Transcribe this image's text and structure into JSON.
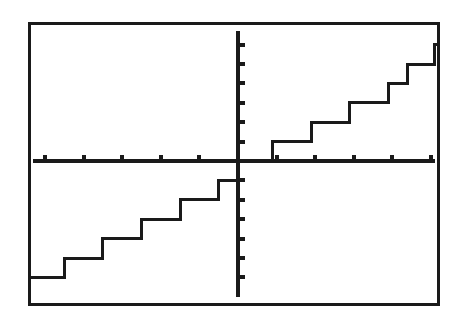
{
  "device": {
    "screen_label": "graphing-calculator-screen",
    "border_color": "#1a1a1a",
    "background_color": "#ffffff",
    "trace_color": "#1a1a1a",
    "border_width_px": 3
  },
  "chart_data": {
    "type": "line",
    "title": "",
    "subtitle": "",
    "xlabel": "",
    "ylabel": "",
    "style": "step-post",
    "grid": false,
    "legend": false,
    "legend_position": "none",
    "axes_shown": [
      "x-axis",
      "y-axis"
    ],
    "axis_color": "#1a1a1a",
    "xlim": [
      -5.5,
      5.5
    ],
    "ylim": [
      -7.0,
      7.0
    ],
    "xtick_interval": 1,
    "ytick_interval": 1,
    "xticks": [
      -5,
      -4,
      -3,
      -2,
      -1,
      1,
      2,
      3,
      4,
      5
    ],
    "yticks": [
      -6,
      -5,
      -4,
      -3,
      -2,
      -1,
      1,
      2,
      3,
      4,
      5,
      6
    ],
    "xtick_labels": [
      "",
      "",
      "",
      "",
      "",
      "",
      "",
      "",
      "",
      ""
    ],
    "ytick_labels": [
      "",
      "",
      "",
      "",
      "",
      "",
      "",
      "",
      "",
      "",
      "",
      ""
    ],
    "series": [
      {
        "name": "step-function",
        "color": "#1a1a1a",
        "line_width_px": 3,
        "steps": [
          {
            "x_start": -5.5,
            "x_end": -4.5,
            "y": -6
          },
          {
            "x_start": -4.5,
            "x_end": -3.5,
            "y": -5
          },
          {
            "x_start": -3.5,
            "x_end": -2.5,
            "y": -4
          },
          {
            "x_start": -2.5,
            "x_end": -1.5,
            "y": -3
          },
          {
            "x_start": -1.5,
            "x_end": -0.5,
            "y": -2
          },
          {
            "x_start": -0.5,
            "x_end": 0.0,
            "y": -1
          },
          {
            "x_start": 0.0,
            "x_end": 0.9,
            "y": 0
          },
          {
            "x_start": 0.9,
            "x_end": 1.9,
            "y": 1
          },
          {
            "x_start": 1.9,
            "x_end": 2.9,
            "y": 2
          },
          {
            "x_start": 2.9,
            "x_end": 3.9,
            "y": 3
          },
          {
            "x_start": 3.9,
            "x_end": 4.4,
            "y": 4
          },
          {
            "x_start": 4.4,
            "x_end": 5.1,
            "y": 5
          },
          {
            "x_start": 5.1,
            "x_end": 5.5,
            "y": 6
          }
        ],
        "x": [
          -5.5,
          -4.5,
          -4.5,
          -3.5,
          -3.5,
          -2.5,
          -2.5,
          -1.5,
          -1.5,
          -0.5,
          -0.5,
          0.0,
          0.0,
          0.9,
          0.9,
          1.9,
          1.9,
          2.9,
          2.9,
          3.9,
          3.9,
          4.4,
          4.4,
          5.1,
          5.1,
          5.5
        ],
        "y": [
          -6,
          -6,
          -5,
          -5,
          -4,
          -4,
          -3,
          -3,
          -2,
          -2,
          -1,
          -1,
          0,
          0,
          1,
          1,
          2,
          2,
          3,
          3,
          4,
          4,
          5,
          5,
          6,
          6
        ]
      }
    ]
  },
  "geometry": {
    "origin_x_px": 238,
    "origin_y_px": 161,
    "x_unit_px": 38.6,
    "y_unit_px": 19.4,
    "screen_left_px": 28,
    "screen_top_px": 22,
    "screen_width_px": 412,
    "screen_height_px": 284
  }
}
